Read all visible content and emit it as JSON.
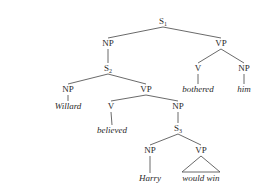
{
  "diagram": {
    "type": "syntax-tree",
    "nodes": [
      {
        "id": "S1",
        "label": "S",
        "sub": "1",
        "x": 163,
        "y": 24,
        "kind": "cat"
      },
      {
        "id": "NP1",
        "label": "NP",
        "sub": "",
        "x": 108,
        "y": 46,
        "kind": "cat"
      },
      {
        "id": "VP1",
        "label": "VP",
        "sub": "",
        "x": 221,
        "y": 46,
        "kind": "cat"
      },
      {
        "id": "S2",
        "label": "S",
        "sub": "2",
        "x": 108,
        "y": 71,
        "kind": "cat"
      },
      {
        "id": "V1",
        "label": "V",
        "sub": "",
        "x": 198,
        "y": 71,
        "kind": "cat"
      },
      {
        "id": "NP2",
        "label": "NP",
        "sub": "",
        "x": 244,
        "y": 71,
        "kind": "cat"
      },
      {
        "id": "w_bothered",
        "label": "bothered",
        "sub": "",
        "x": 198,
        "y": 92,
        "kind": "word"
      },
      {
        "id": "w_him",
        "label": "him",
        "sub": "",
        "x": 244,
        "y": 92,
        "kind": "word"
      },
      {
        "id": "NP3",
        "label": "NP",
        "sub": "",
        "x": 68,
        "y": 92,
        "kind": "cat"
      },
      {
        "id": "VP2",
        "label": "VP",
        "sub": "",
        "x": 146,
        "y": 92,
        "kind": "cat"
      },
      {
        "id": "w_willard",
        "label": "Willard",
        "sub": "",
        "x": 68,
        "y": 109,
        "kind": "word"
      },
      {
        "id": "V2",
        "label": "V",
        "sub": "",
        "x": 111,
        "y": 109,
        "kind": "cat"
      },
      {
        "id": "NP4",
        "label": "NP",
        "sub": "",
        "x": 178,
        "y": 109,
        "kind": "cat"
      },
      {
        "id": "w_believed",
        "label": "believed",
        "sub": "",
        "x": 112,
        "y": 133,
        "kind": "word"
      },
      {
        "id": "S3",
        "label": "S",
        "sub": "3",
        "x": 178,
        "y": 131,
        "kind": "cat"
      },
      {
        "id": "NP5",
        "label": "NP",
        "sub": "",
        "x": 150,
        "y": 153,
        "kind": "cat"
      },
      {
        "id": "VP3",
        "label": "VP",
        "sub": "",
        "x": 201,
        "y": 153,
        "kind": "cat"
      },
      {
        "id": "w_harry",
        "label": "Harry",
        "sub": "",
        "x": 150,
        "y": 181,
        "kind": "word"
      },
      {
        "id": "w_wouldwin",
        "label": "would win",
        "sub": "",
        "x": 201,
        "y": 181,
        "kind": "word"
      }
    ],
    "edges": [
      [
        "S1",
        "NP1"
      ],
      [
        "S1",
        "VP1"
      ],
      [
        "NP1",
        "S2"
      ],
      [
        "VP1",
        "V1"
      ],
      [
        "VP1",
        "NP2"
      ],
      [
        "V1",
        "w_bothered"
      ],
      [
        "NP2",
        "w_him"
      ],
      [
        "S2",
        "NP3"
      ],
      [
        "S2",
        "VP2"
      ],
      [
        "NP3",
        "w_willard"
      ],
      [
        "VP2",
        "V2"
      ],
      [
        "VP2",
        "NP4"
      ],
      [
        "V2",
        "w_believed"
      ],
      [
        "NP4",
        "S3"
      ],
      [
        "S3",
        "NP5"
      ],
      [
        "S3",
        "VP3"
      ],
      [
        "NP5",
        "w_harry"
      ]
    ],
    "triangles": [
      {
        "parent": "VP3",
        "child": "w_wouldwin",
        "half_width": 19
      }
    ],
    "colors": {
      "ink": "#2a2a2a",
      "line": "#444444",
      "background": "#ffffff"
    }
  }
}
